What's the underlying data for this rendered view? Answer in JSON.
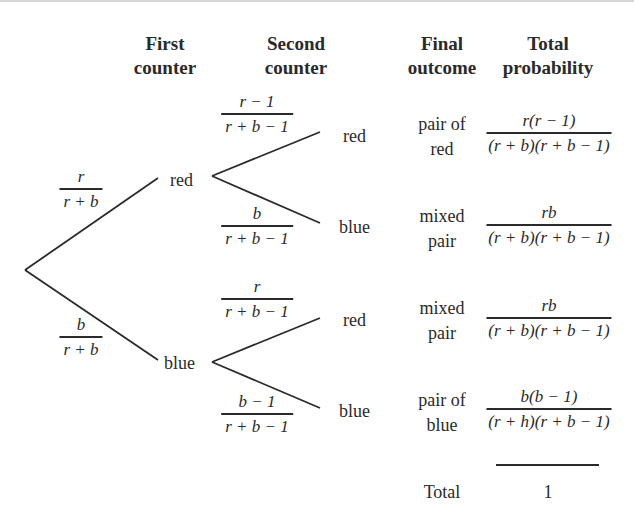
{
  "headers": {
    "first_counter": [
      "First",
      "counter"
    ],
    "second_counter": [
      "Second",
      "counter"
    ],
    "final_outcome": [
      "Final",
      "outcome"
    ],
    "total_probability": [
      "Total",
      "probability"
    ]
  },
  "first_level": {
    "red": {
      "label": "red",
      "probability": {
        "numerator": "r",
        "denominator": "r + b"
      }
    },
    "blue": {
      "label": "blue",
      "probability": {
        "numerator": "b",
        "denominator": "r + b"
      }
    }
  },
  "second_level": {
    "red_red": {
      "label": "red",
      "probability": {
        "numerator": "r − 1",
        "denominator": "r + b − 1"
      }
    },
    "red_blue": {
      "label": "blue",
      "probability": {
        "numerator": "b",
        "denominator": "r + b − 1"
      }
    },
    "blue_red": {
      "label": "red",
      "probability": {
        "numerator": "r",
        "denominator": "r + b − 1"
      }
    },
    "blue_blue": {
      "label": "blue",
      "probability": {
        "numerator": "b − 1",
        "denominator": "r + b − 1"
      }
    }
  },
  "outcomes": [
    {
      "line1": "pair of",
      "line2": "red",
      "numerator": "r(r − 1)",
      "denominator": "(r + b)(r + b − 1)"
    },
    {
      "line1": "mixed",
      "line2": "pair",
      "numerator": "rb",
      "denominator": "(r + b)(r + b − 1)"
    },
    {
      "line1": "mixed",
      "line2": "pair",
      "numerator": "rb",
      "denominator": "(r + b)(r + b − 1)"
    },
    {
      "line1": "pair of",
      "line2": "blue",
      "numerator": "b(b − 1)",
      "denominator": "(r + h)(r + b − 1)"
    }
  ],
  "total": {
    "label": "Total",
    "value": "1"
  }
}
